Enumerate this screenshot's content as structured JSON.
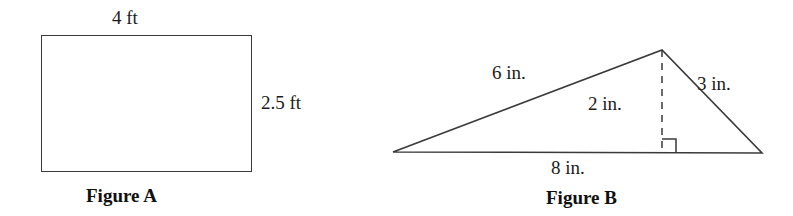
{
  "page": {
    "background_color": "#ffffff",
    "stroke_color": "#3a3a3a",
    "text_color": "#1b1b1b",
    "width": 793,
    "height": 216
  },
  "figures": [
    {
      "id": "figure-a",
      "caption": "Figure A",
      "shape": "rectangle",
      "labels": {
        "width": "4 ft",
        "height": "2.5 ft"
      },
      "geometry": {
        "left": 41,
        "top": 35,
        "width": 211,
        "height": 137
      },
      "measurements": {
        "width_value": 4,
        "height_value": 2.5,
        "unit": "ft"
      }
    },
    {
      "id": "figure-b",
      "caption": "Figure B",
      "shape": "triangle",
      "labels": {
        "left_side": "6 in.",
        "right_side": "3 in.",
        "altitude": "2 in.",
        "base": "8 in."
      },
      "geometry": {
        "left_vertex": [
          33,
          152
        ],
        "apex": [
          302,
          50
        ],
        "right_vertex": [
          402,
          153
        ],
        "altitude_foot": [
          302,
          153
        ],
        "right_angle_marker": {
          "x": 302,
          "y": 139,
          "size": 14,
          "side": "right"
        }
      },
      "measurements": {
        "left_side_value": 6,
        "right_side_value": 3,
        "altitude_value": 2,
        "base_value": 8,
        "unit": "in."
      }
    }
  ]
}
